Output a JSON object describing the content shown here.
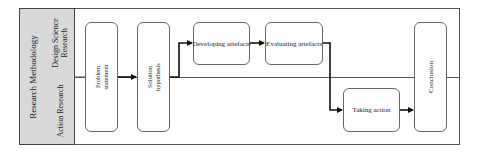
{
  "diagram": {
    "title_column": "Research Methodology",
    "lanes": [
      {
        "label_line1": "Design Science",
        "label_line2": "Research"
      },
      {
        "label_line1": "Action Research",
        "label_line2": ""
      }
    ],
    "nodes": {
      "problem": {
        "line1": "Problem",
        "line2": "statement"
      },
      "solution": {
        "line1": "Solution",
        "line2": "hypothesis"
      },
      "developing": {
        "label": "Developing artefacts"
      },
      "evaluating": {
        "label": "Evaluating artefacts"
      },
      "taking": {
        "label": "Taking action"
      },
      "conclusion": {
        "label": "Conclusion"
      }
    },
    "edges": [
      {
        "from": "Problem statement",
        "to": "Solution hypothesis"
      },
      {
        "from": "Solution hypothesis",
        "to": "Developing artefacts"
      },
      {
        "from": "Developing artefacts",
        "to": "Evaluating artefacts"
      },
      {
        "from": "Evaluating artefacts",
        "to": "Taking action"
      },
      {
        "from": "Taking action",
        "to": "Conclusion"
      }
    ]
  }
}
